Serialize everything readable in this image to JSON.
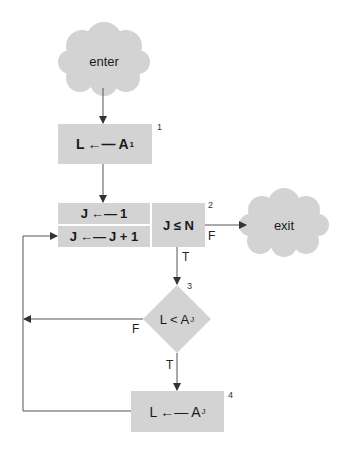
{
  "diagram": {
    "type": "flowchart",
    "colors": {
      "node_fill": "#d3d3d3",
      "line": "#555555",
      "text": "#1a1a1a",
      "background": "#ffffff"
    },
    "nodes": {
      "enter": {
        "shape": "cloud",
        "label": "enter"
      },
      "step1": {
        "shape": "rect",
        "number": "1",
        "lhs": "L",
        "arrow": "←—",
        "rhs": "A",
        "rhs_sub": "1"
      },
      "init_j": {
        "shape": "rect",
        "lhs": "J",
        "arrow": "←—",
        "rhs": "1"
      },
      "incr_j": {
        "shape": "rect",
        "lhs": "J",
        "arrow": "←—",
        "rhs": "J + 1"
      },
      "test_j": {
        "shape": "rect",
        "number": "2",
        "label": "J ≤ N"
      },
      "exit": {
        "shape": "cloud",
        "label": "exit"
      },
      "compare": {
        "shape": "diamond",
        "number": "3",
        "lhs": "L < A",
        "sub": "J"
      },
      "step4": {
        "shape": "rect",
        "number": "4",
        "lhs": "L",
        "arrow": "←—",
        "rhs": "A",
        "rhs_sub": "J"
      }
    },
    "edge_labels": {
      "test_false": "F",
      "test_true": "T",
      "compare_false": "F",
      "compare_true": "T"
    }
  }
}
